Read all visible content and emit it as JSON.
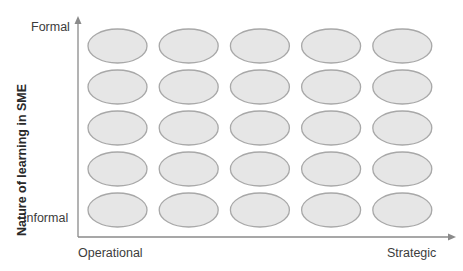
{
  "diagram": {
    "y_axis": {
      "title": "Nature of learning in SME",
      "top_label": "Formal",
      "bottom_label": "Informal"
    },
    "x_axis": {
      "left_label": "Operational",
      "right_label": "Strategic"
    },
    "grid": {
      "rows": 5,
      "columns": 5
    },
    "colors": {
      "ellipse_fill": "#e6e6e6",
      "ellipse_stroke": "#a8a8a8",
      "axis": "#8a8a8a"
    }
  }
}
